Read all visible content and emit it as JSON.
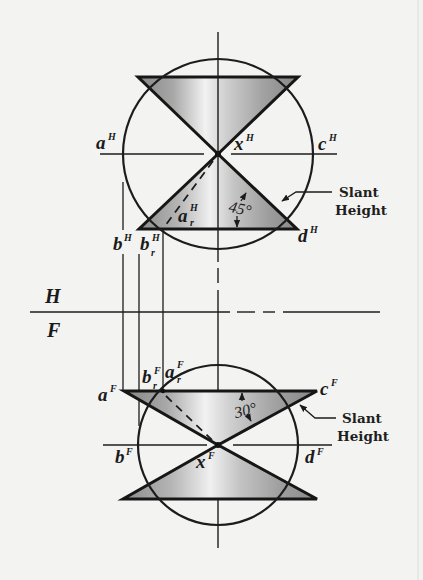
{
  "figure": {
    "colors": {
      "background": "#f3f3f1",
      "line": "#1c1c1c",
      "shade_dark": "#8a8a8a",
      "shade_light": "#f2f2f2"
    },
    "top_view": {
      "points": [
        {
          "name": "a",
          "base": "a",
          "sup": "H"
        },
        {
          "name": "x",
          "base": "x",
          "sup": "H"
        },
        {
          "name": "c",
          "base": "c",
          "sup": "H"
        },
        {
          "name": "b",
          "base": "b",
          "sup": "H"
        },
        {
          "name": "b_r",
          "base": "b",
          "sup": "H",
          "sub": "r"
        },
        {
          "name": "a_r",
          "base": "a",
          "sup": "H",
          "sub": "r"
        },
        {
          "name": "d",
          "base": "d",
          "sup": "H"
        }
      ],
      "angle_label": "45°",
      "callout": {
        "line1": "Slant",
        "line2": "Height"
      }
    },
    "reference_line": {
      "upper": "H",
      "lower": "F"
    },
    "front_view": {
      "points": [
        {
          "name": "a",
          "base": "a",
          "sup": "F"
        },
        {
          "name": "b_r",
          "base": "b",
          "sup": "F",
          "sub": "r"
        },
        {
          "name": "a_r",
          "base": "a",
          "sup": "F",
          "sub": "r"
        },
        {
          "name": "c",
          "base": "c",
          "sup": "F"
        },
        {
          "name": "b",
          "base": "b",
          "sup": "F"
        },
        {
          "name": "x",
          "base": "x",
          "sup": "F"
        },
        {
          "name": "d",
          "base": "d",
          "sup": "F"
        }
      ],
      "angle_label": "30°",
      "callout": {
        "line1": "Slant",
        "line2": "Height"
      }
    }
  }
}
